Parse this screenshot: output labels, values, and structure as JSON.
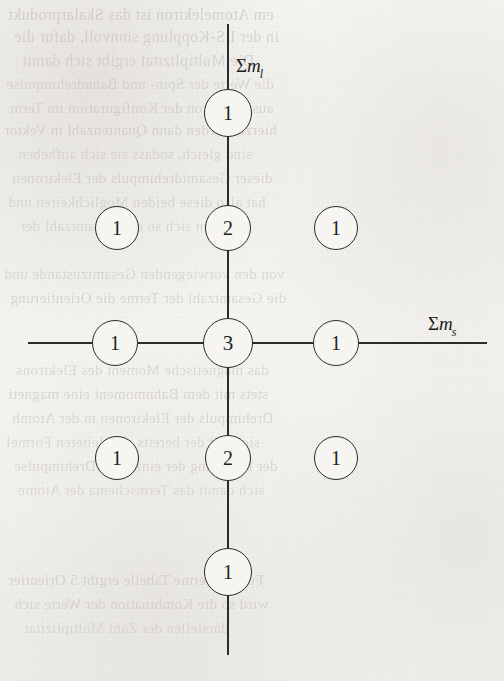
{
  "figure": {
    "type": "coordinate-diagram",
    "background_color": "#f5f4f2",
    "ink_color": "#2b2927",
    "axes": {
      "vertical": {
        "name": "sum-ml-axis",
        "label_sigma": "Σ",
        "label_var": "m",
        "label_sub": "l",
        "label_text": "Σm_l",
        "x": 228,
        "y_start": 24,
        "y_end": 655,
        "label_x": 236,
        "label_y": 56
      },
      "horizontal": {
        "name": "sum-ms-axis",
        "label_sigma": "Σ",
        "label_var": "m",
        "label_sub": "s",
        "label_text": "Σm_s",
        "y": 343,
        "x_start": 28,
        "x_end": 487,
        "label_x": 428,
        "label_y": 314
      }
    },
    "nodes": [
      {
        "name": "node-top",
        "value": "1",
        "cx": 228,
        "cy": 113,
        "r": 24,
        "font_size": 20,
        "on_axis": true
      },
      {
        "name": "node-upper-left",
        "value": "1",
        "cx": 117,
        "cy": 228,
        "r": 22,
        "font_size": 20,
        "on_axis": false
      },
      {
        "name": "node-upper-center",
        "value": "2",
        "cx": 228,
        "cy": 228,
        "r": 23,
        "font_size": 20,
        "on_axis": true
      },
      {
        "name": "node-upper-right",
        "value": "1",
        "cx": 336,
        "cy": 228,
        "r": 22,
        "font_size": 20,
        "on_axis": false
      },
      {
        "name": "node-middle-left",
        "value": "1",
        "cx": 115,
        "cy": 343,
        "r": 23,
        "font_size": 20,
        "on_axis": true
      },
      {
        "name": "node-center",
        "value": "3",
        "cx": 228,
        "cy": 343,
        "r": 25,
        "font_size": 21,
        "on_axis": true
      },
      {
        "name": "node-middle-right",
        "value": "1",
        "cx": 336,
        "cy": 343,
        "r": 23,
        "font_size": 20,
        "on_axis": true
      },
      {
        "name": "node-lower-left",
        "value": "1",
        "cx": 117,
        "cy": 458,
        "r": 22,
        "font_size": 20,
        "on_axis": false
      },
      {
        "name": "node-lower-center",
        "value": "2",
        "cx": 228,
        "cy": 458,
        "r": 23,
        "font_size": 20,
        "on_axis": true
      },
      {
        "name": "node-lower-right",
        "value": "1",
        "cx": 336,
        "cy": 458,
        "r": 22,
        "font_size": 20,
        "on_axis": false
      },
      {
        "name": "node-bottom",
        "value": "1",
        "cx": 228,
        "cy": 572,
        "r": 24,
        "font_size": 20,
        "on_axis": true
      }
    ]
  },
  "chart_data": {
    "type": "scatter",
    "title": "",
    "xlabel": "Σm_s",
    "ylabel": "Σm_l",
    "grid": false,
    "legend": null,
    "x_categories": [
      "-1",
      "0",
      "+1"
    ],
    "y_categories": [
      "+2",
      "+1",
      "0",
      "-1",
      "-2"
    ],
    "points": [
      {
        "x": 0,
        "y": 2,
        "value": 1
      },
      {
        "x": -1,
        "y": 1,
        "value": 1
      },
      {
        "x": 0,
        "y": 1,
        "value": 2
      },
      {
        "x": 1,
        "y": 1,
        "value": 1
      },
      {
        "x": -1,
        "y": 0,
        "value": 1
      },
      {
        "x": 0,
        "y": 0,
        "value": 3
      },
      {
        "x": 1,
        "y": 0,
        "value": 1
      },
      {
        "x": -1,
        "y": -1,
        "value": 1
      },
      {
        "x": 0,
        "y": -1,
        "value": 2
      },
      {
        "x": 1,
        "y": -1,
        "value": 1
      },
      {
        "x": 0,
        "y": -2,
        "value": 1
      }
    ],
    "values": [
      1,
      1,
      2,
      1,
      1,
      3,
      1,
      1,
      2,
      1,
      1
    ]
  },
  "ghost_text": {
    "description": "Faint mirrored show-through text printed on the reverse side of the scanned page",
    "lines": [
      {
        "text": "em Atomelektron ist das Skalarprodukt",
        "x": 8,
        "y": 6,
        "size": 16,
        "opacity": 0.5
      },
      {
        "text": "in der LS-Kopplung sinnvoll, dafur die",
        "x": 14,
        "y": 28,
        "size": 16,
        "opacity": 0.46
      },
      {
        "text": "Die Multiplizitat ergibt sich damit",
        "x": 22,
        "y": 52,
        "size": 16,
        "opacity": 0.44
      },
      {
        "text": "die Werte der Spin- und Bahndrehimpulse",
        "x": 6,
        "y": 76,
        "size": 15,
        "opacity": 0.42
      },
      {
        "text": "ausgehen von der Konfiguration im Term",
        "x": 10,
        "y": 100,
        "size": 15,
        "opacity": 0.44
      },
      {
        "text": "hierzu werden dann Quantenzahl in Vektor",
        "x": 4,
        "y": 122,
        "size": 15,
        "opacity": 0.46
      },
      {
        "text": "sind gleich, sodass sie sich aufheben",
        "x": 18,
        "y": 146,
        "size": 15,
        "opacity": 0.42
      },
      {
        "text": "dieser Gesamtdrehimpuls der Elektronen",
        "x": 12,
        "y": 170,
        "size": 15,
        "opacity": 0.44
      },
      {
        "text": "hat also diese beiden Moglichkeiten und",
        "x": 8,
        "y": 194,
        "size": 15,
        "opacity": 0.42
      },
      {
        "text": "ergeben sich so die Gesamtzahl der",
        "x": 20,
        "y": 218,
        "size": 15,
        "opacity": 0.4
      },
      {
        "text": "von den vorwiegenden Gesamtzustande und",
        "x": 4,
        "y": 266,
        "size": 15,
        "opacity": 0.42
      },
      {
        "text": "die Gesamtzahl der Terme die Orientierung",
        "x": 10,
        "y": 290,
        "size": 15,
        "opacity": 0.44
      },
      {
        "text": "das magnetische Moment des Elektrons",
        "x": 16,
        "y": 362,
        "size": 15,
        "opacity": 0.42
      },
      {
        "text": "stets mit dem Bahnmoment eine magneti",
        "x": 8,
        "y": 386,
        "size": 15,
        "opacity": 0.44
      },
      {
        "text": "Drehimpuls der Elektronen in der Atomh",
        "x": 12,
        "y": 410,
        "size": 15,
        "opacity": 0.42
      },
      {
        "text": "sich mit der bereits abgeleiteten Formel",
        "x": 6,
        "y": 434,
        "size": 15,
        "opacity": 0.4
      },
      {
        "text": "der Kopplung der einzelnen Drehimpulse",
        "x": 14,
        "y": 458,
        "size": 15,
        "opacity": 0.42
      },
      {
        "text": "sich damit das Termschema der Atome",
        "x": 18,
        "y": 482,
        "size": 15,
        "opacity": 0.38
      },
      {
        "text": "Fur die Terme Tabelle ergibt 5 Orientier",
        "x": 8,
        "y": 572,
        "size": 15,
        "opacity": 0.44
      },
      {
        "text": "wird so die Kombination der Werte sich",
        "x": 14,
        "y": 596,
        "size": 15,
        "opacity": 0.42
      },
      {
        "text": "darstellen der Zahl Multiplizitat",
        "x": 24,
        "y": 620,
        "size": 15,
        "opacity": 0.36
      }
    ]
  }
}
